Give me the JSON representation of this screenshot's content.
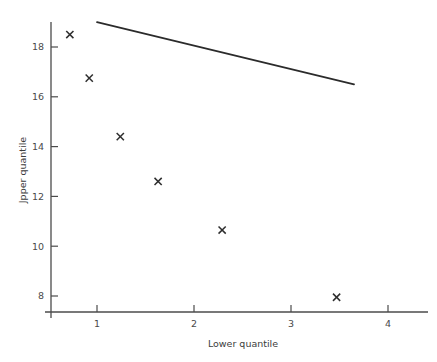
{
  "chart_data": {
    "type": "scatter",
    "title": "",
    "xlabel": "Lower quantile",
    "ylabel": "Jpper quantile",
    "xlim": [
      0.55,
      4.4
    ],
    "ylim": [
      6.9,
      19.4
    ],
    "xticks": [
      1,
      2,
      3,
      4
    ],
    "xtick_labels": [
      "1",
      "2",
      "3",
      "4"
    ],
    "yticks": [
      8,
      10,
      12,
      14,
      16,
      18
    ],
    "ytick_labels": [
      "8",
      "10",
      "12",
      "14",
      "16",
      "18"
    ],
    "grid": false,
    "legend": null,
    "marker_symbol": "x",
    "marker_color": "#2e2e2e",
    "line_color": "#2b2b2b",
    "axis_color": "#4b4b4b",
    "points": [
      {
        "x": 0.72,
        "y": 18.5
      },
      {
        "x": 0.92,
        "y": 16.75
      },
      {
        "x": 1.24,
        "y": 14.4
      },
      {
        "x": 1.63,
        "y": 12.6
      },
      {
        "x": 2.29,
        "y": 10.65
      },
      {
        "x": 3.47,
        "y": 7.95
      }
    ],
    "fit_line": {
      "x_start": 1.0,
      "y_start": 19.0,
      "x_end": 3.65,
      "y_end": 16.5
    }
  }
}
